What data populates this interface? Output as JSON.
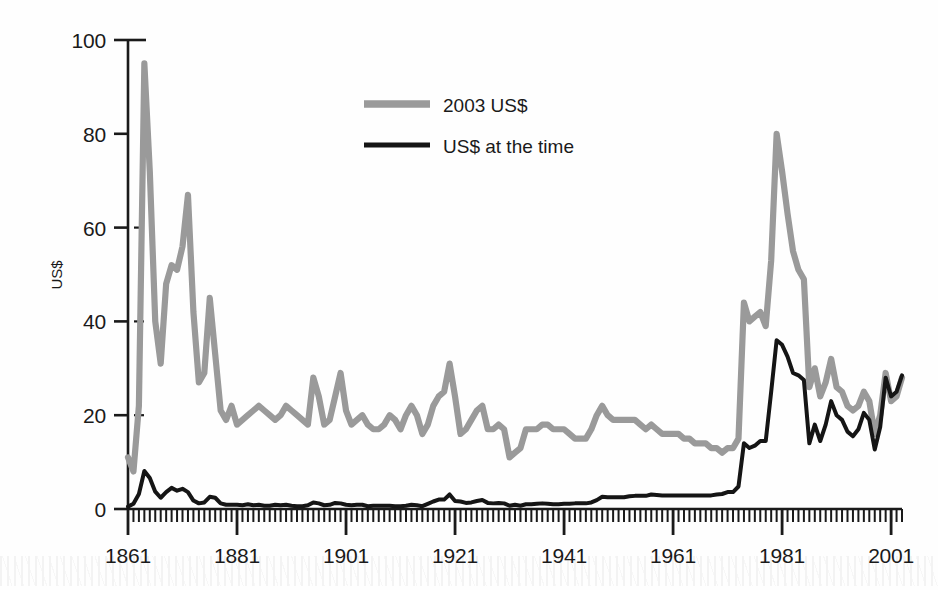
{
  "chart_data": {
    "type": "line",
    "title": "",
    "xlabel": "",
    "ylabel": "US$",
    "xlim": [
      1861,
      2003
    ],
    "ylim": [
      0,
      100
    ],
    "grid": false,
    "legend_position": "top-center",
    "x_ticks": [
      "1861",
      "1881",
      "1901",
      "1921",
      "1941",
      "1961",
      "1981",
      "2001"
    ],
    "x_tick_values": [
      1861,
      1881,
      1901,
      1921,
      1941,
      1961,
      1981,
      2001
    ],
    "y_ticks": [
      "0",
      "20",
      "40",
      "60",
      "80",
      "100"
    ],
    "y_tick_values": [
      0,
      20,
      40,
      60,
      80,
      100
    ],
    "minor_tick_interval": 1,
    "colors": {
      "series_2003_usd": "#9a9a9a",
      "series_nominal": "#151515",
      "axis": "#1a1a1a",
      "background": "#fefefe"
    },
    "series": [
      {
        "name": "2003 US$",
        "color": "#9a9a9a",
        "x": [
          1861,
          1862,
          1863,
          1864,
          1865,
          1866,
          1867,
          1868,
          1869,
          1870,
          1871,
          1872,
          1873,
          1874,
          1875,
          1876,
          1877,
          1878,
          1879,
          1880,
          1881,
          1882,
          1883,
          1884,
          1885,
          1886,
          1887,
          1888,
          1889,
          1890,
          1891,
          1892,
          1893,
          1894,
          1895,
          1896,
          1897,
          1898,
          1899,
          1900,
          1901,
          1902,
          1903,
          1904,
          1905,
          1906,
          1907,
          1908,
          1909,
          1910,
          1911,
          1912,
          1913,
          1914,
          1915,
          1916,
          1917,
          1918,
          1919,
          1920,
          1921,
          1922,
          1923,
          1924,
          1925,
          1926,
          1927,
          1928,
          1929,
          1930,
          1931,
          1932,
          1933,
          1934,
          1935,
          1936,
          1937,
          1938,
          1939,
          1940,
          1941,
          1942,
          1943,
          1944,
          1945,
          1946,
          1947,
          1948,
          1949,
          1950,
          1951,
          1952,
          1953,
          1954,
          1955,
          1956,
          1957,
          1958,
          1959,
          1960,
          1961,
          1962,
          1963,
          1964,
          1965,
          1966,
          1967,
          1968,
          1969,
          1970,
          1971,
          1972,
          1973,
          1974,
          1975,
          1976,
          1977,
          1978,
          1979,
          1980,
          1981,
          1982,
          1983,
          1984,
          1985,
          1986,
          1987,
          1988,
          1989,
          1990,
          1991,
          1992,
          1993,
          1994,
          1995,
          1996,
          1997,
          1998,
          1999,
          2000,
          2001,
          2002,
          2003
        ],
        "values": [
          11.0,
          8.0,
          22.0,
          95.0,
          72.0,
          40.0,
          31.0,
          48.0,
          52.0,
          51.0,
          56.0,
          67.0,
          42.0,
          27.0,
          29.0,
          45.0,
          33.0,
          21.0,
          19.0,
          22.0,
          18.0,
          19.0,
          20.0,
          21.0,
          22.0,
          21.0,
          20.0,
          19.0,
          20.0,
          22.0,
          21.0,
          20.0,
          19.0,
          18.0,
          28.0,
          24.0,
          18.0,
          19.0,
          24.0,
          29.0,
          21.0,
          18.0,
          19.0,
          20.0,
          18.0,
          17.0,
          17.0,
          18.0,
          20.0,
          19.0,
          17.0,
          20.0,
          22.0,
          20.0,
          16.0,
          18.0,
          22.0,
          24.0,
          25.0,
          31.0,
          24.0,
          16.0,
          17.0,
          19.0,
          21.0,
          22.0,
          17.0,
          17.0,
          18.0,
          17.0,
          11.0,
          12.0,
          13.0,
          17.0,
          17.0,
          17.0,
          18.0,
          18.0,
          17.0,
          17.0,
          17.0,
          16.0,
          15.0,
          15.0,
          15.0,
          17.0,
          20.0,
          22.0,
          20.0,
          19.0,
          19.0,
          19.0,
          19.0,
          19.0,
          18.0,
          17.0,
          18.0,
          17.0,
          16.0,
          16.0,
          16.0,
          16.0,
          15.0,
          15.0,
          14.0,
          14.0,
          14.0,
          13.0,
          13.0,
          12.0,
          13.0,
          13.0,
          15.0,
          44.0,
          40.0,
          41.0,
          42.0,
          39.0,
          53.0,
          80.0,
          72.0,
          63.0,
          55.0,
          51.0,
          49.0,
          26.0,
          30.0,
          24.0,
          27.0,
          32.0,
          26.0,
          25.0,
          22.0,
          21.0,
          22.0,
          25.0,
          23.0,
          16.0,
          20.0,
          29.0,
          23.0,
          24.0,
          28.0
        ]
      },
      {
        "name": "US$ at the time",
        "color": "#151515",
        "x": [
          1861,
          1862,
          1863,
          1864,
          1865,
          1866,
          1867,
          1868,
          1869,
          1870,
          1871,
          1872,
          1873,
          1874,
          1875,
          1876,
          1877,
          1878,
          1879,
          1880,
          1881,
          1882,
          1883,
          1884,
          1885,
          1886,
          1887,
          1888,
          1889,
          1890,
          1891,
          1892,
          1893,
          1894,
          1895,
          1896,
          1897,
          1898,
          1899,
          1900,
          1901,
          1902,
          1903,
          1904,
          1905,
          1906,
          1907,
          1908,
          1909,
          1910,
          1911,
          1912,
          1913,
          1914,
          1915,
          1916,
          1917,
          1918,
          1919,
          1920,
          1921,
          1922,
          1923,
          1924,
          1925,
          1926,
          1927,
          1928,
          1929,
          1930,
          1931,
          1932,
          1933,
          1934,
          1935,
          1936,
          1937,
          1938,
          1939,
          1940,
          1941,
          1942,
          1943,
          1944,
          1945,
          1946,
          1947,
          1948,
          1949,
          1950,
          1951,
          1952,
          1953,
          1954,
          1955,
          1956,
          1957,
          1958,
          1959,
          1960,
          1961,
          1962,
          1963,
          1964,
          1965,
          1966,
          1967,
          1968,
          1969,
          1970,
          1971,
          1972,
          1973,
          1974,
          1975,
          1976,
          1977,
          1978,
          1979,
          1980,
          1981,
          1982,
          1983,
          1984,
          1985,
          1986,
          1987,
          1988,
          1989,
          1990,
          1991,
          1992,
          1993,
          1994,
          1995,
          1996,
          1997,
          1998,
          1999,
          2000,
          2001,
          2002,
          2003
        ],
        "values": [
          0.5,
          1.1,
          3.2,
          8.1,
          6.6,
          3.7,
          2.4,
          3.6,
          4.5,
          3.9,
          4.3,
          3.6,
          1.8,
          1.2,
          1.4,
          2.6,
          2.4,
          1.2,
          0.9,
          0.9,
          0.9,
          0.8,
          1.0,
          0.8,
          0.9,
          0.7,
          0.7,
          0.9,
          0.8,
          0.9,
          0.7,
          0.6,
          0.6,
          0.8,
          1.4,
          1.2,
          0.8,
          0.9,
          1.3,
          1.2,
          0.9,
          0.8,
          0.9,
          0.9,
          0.6,
          0.7,
          0.7,
          0.7,
          0.7,
          0.6,
          0.6,
          0.7,
          0.9,
          0.8,
          0.6,
          1.1,
          1.6,
          2.0,
          2.0,
          3.1,
          1.7,
          1.6,
          1.3,
          1.4,
          1.7,
          1.9,
          1.3,
          1.2,
          1.3,
          1.2,
          0.7,
          0.9,
          0.7,
          1.0,
          1.0,
          1.1,
          1.2,
          1.1,
          1.0,
          1.0,
          1.1,
          1.1,
          1.2,
          1.2,
          1.2,
          1.4,
          1.9,
          2.6,
          2.5,
          2.5,
          2.5,
          2.5,
          2.7,
          2.8,
          2.8,
          2.8,
          3.1,
          3.0,
          2.9,
          2.9,
          2.9,
          2.9,
          2.9,
          2.9,
          2.9,
          2.9,
          2.9,
          2.9,
          3.1,
          3.2,
          3.6,
          3.6,
          4.8,
          14.0,
          13.0,
          13.5,
          14.5,
          14.5,
          25.0,
          36.0,
          35.0,
          32.5,
          29.0,
          28.5,
          27.5,
          14.0,
          18.0,
          14.5,
          18.0,
          23.0,
          20.0,
          19.0,
          16.5,
          15.5,
          17.0,
          20.5,
          19.0,
          12.7,
          17.5,
          28.0,
          24.0,
          25.0,
          28.5
        ]
      }
    ]
  },
  "legend": {
    "items": [
      {
        "label": "2003 US$",
        "color": "#9a9a9a",
        "thick": true
      },
      {
        "label": "US$ at the time",
        "color": "#151515",
        "thick": false
      }
    ]
  },
  "axis": {
    "y_title": "US$"
  }
}
